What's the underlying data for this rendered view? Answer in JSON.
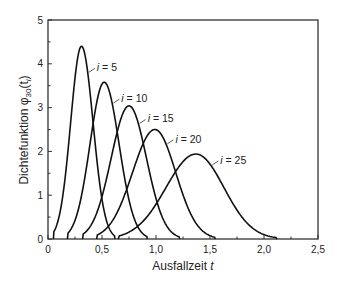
{
  "chart_data": {
    "type": "line",
    "title": "",
    "xlabel": "Ausfallzeit",
    "xlabel_var": "t",
    "ylabel": "Dichtefunktion φ30(ti)",
    "ylabel_text": "Dichtefunktion ",
    "ylabel_symbol": "φ",
    "ylabel_sub": "30",
    "ylabel_arg": "(t",
    "ylabel_arg_sub": "i",
    "ylabel_close": ")",
    "xlim": [
      0,
      2.5
    ],
    "ylim": [
      0,
      5
    ],
    "grid": false,
    "legend": "inline labels",
    "x_ticks": [
      "0",
      "0,5",
      "1,0",
      "1,5",
      "2,0",
      "2,5"
    ],
    "x_tick_values": [
      0,
      0.5,
      1.0,
      1.5,
      2.0,
      2.5
    ],
    "y_ticks": [
      "0",
      "1",
      "2",
      "3",
      "4",
      "5"
    ],
    "y_tick_values": [
      0,
      1,
      2,
      3,
      4,
      5
    ],
    "series": [
      {
        "name": "i = 5",
        "label_var": "i",
        "label_val": " = 5",
        "peak_t": 0.31,
        "peak_y": 4.4,
        "support": [
          0.05,
          0.62
        ]
      },
      {
        "name": "i = 10",
        "label_var": "i",
        "label_val": " = 10",
        "peak_t": 0.52,
        "peak_y": 3.58,
        "support": [
          0.18,
          0.92
        ]
      },
      {
        "name": "i = 15",
        "label_var": "i",
        "label_val": " = 15",
        "peak_t": 0.75,
        "peak_y": 3.04,
        "support": [
          0.32,
          1.22
        ]
      },
      {
        "name": "i = 20",
        "label_var": "i",
        "label_val": " = 20",
        "peak_t": 0.99,
        "peak_y": 2.5,
        "support": [
          0.45,
          1.55
        ]
      },
      {
        "name": "i = 25",
        "label_var": "i",
        "label_val": " = 25",
        "peak_t": 1.37,
        "peak_y": 1.94,
        "support": [
          0.65,
          2.12
        ]
      }
    ]
  }
}
